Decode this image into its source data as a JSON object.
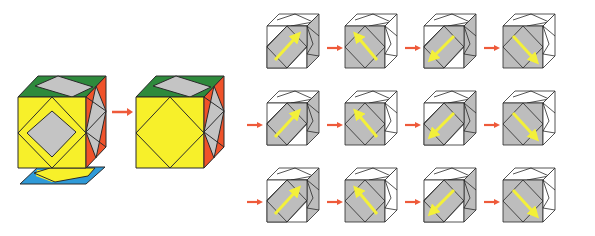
{
  "figure": {
    "colors": {
      "yellow": "#f7f02a",
      "green": "#2e8a3c",
      "orange": "#f0522a",
      "gray": "#c4c4c4",
      "blue": "#2f9ad8",
      "white": "#ffffff",
      "shade": "#bdbdbd",
      "arrow_red": "#ee5a3a",
      "arrow_yellow": "#f3f03a",
      "edge": "#2a2a2a"
    },
    "left_panel": {
      "cube_before": {
        "label": "cube-before",
        "faces": [
          "yellow-front",
          "green-top",
          "orange-right"
        ],
        "separated_bottom_layer": "blue-yellow"
      },
      "cube_after": {
        "label": "cube-after",
        "faces": [
          "yellow-front",
          "green-top",
          "orange-right"
        ]
      }
    },
    "grid": {
      "rows": 3,
      "columns": 4,
      "arrows_per_row": [
        "up-right",
        "up-left",
        "down-left",
        "down-right"
      ]
    }
  }
}
